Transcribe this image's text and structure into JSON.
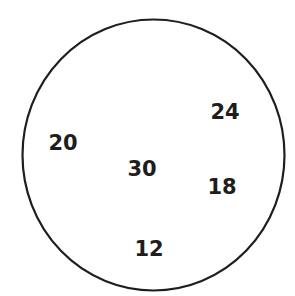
{
  "diagram": {
    "shape": "circle",
    "stroke_color": "#1e1e1e",
    "background": "#ffffff",
    "numbers": [
      {
        "value": "20",
        "x": 63,
        "y": 143
      },
      {
        "value": "24",
        "x": 225,
        "y": 112
      },
      {
        "value": "30",
        "x": 142,
        "y": 169
      },
      {
        "value": "18",
        "x": 222,
        "y": 187
      },
      {
        "value": "12",
        "x": 149,
        "y": 249
      }
    ]
  }
}
